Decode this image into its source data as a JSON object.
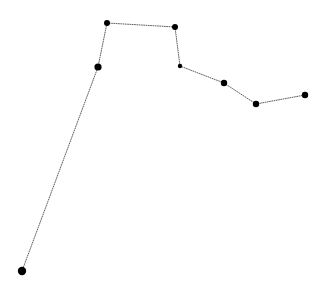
{
  "figure": {
    "width": 333,
    "height": 293,
    "background_color": "#ffffff"
  },
  "chart_data": {
    "type": "line",
    "title": "",
    "subtitle": "",
    "xlabel": "",
    "ylabel": "",
    "grid": false,
    "legend": null,
    "axes_visible": false,
    "tick_labels_x": [],
    "tick_labels_y": [],
    "line_style": "dotted",
    "line_color": "#333333",
    "line_width": 0.8,
    "marker_style": "circle",
    "marker_color": "#000000",
    "series": [
      {
        "name": "series-1",
        "points": [
          {
            "index": 0,
            "x": 22,
            "y": 271,
            "marker_radius": 4.2
          },
          {
            "index": 1,
            "x": 98,
            "y": 67,
            "marker_radius": 3.6
          },
          {
            "index": 2,
            "x": 107,
            "y": 23,
            "marker_radius": 3.0
          },
          {
            "index": 3,
            "x": 175,
            "y": 27,
            "marker_radius": 3.0
          },
          {
            "index": 4,
            "x": 180,
            "y": 66,
            "marker_radius": 2.2
          },
          {
            "index": 5,
            "x": 224,
            "y": 83,
            "marker_radius": 3.2
          },
          {
            "index": 6,
            "x": 256,
            "y": 104,
            "marker_radius": 3.2
          },
          {
            "index": 7,
            "x": 305,
            "y": 95,
            "marker_radius": 3.2
          }
        ],
        "x": [
          22,
          98,
          107,
          175,
          180,
          224,
          256,
          305
        ],
        "values": [
          271,
          67,
          23,
          27,
          66,
          83,
          104,
          95
        ]
      }
    ],
    "xlim": [
      0,
      333
    ],
    "ylim": [
      293,
      0
    ],
    "annotations": []
  }
}
